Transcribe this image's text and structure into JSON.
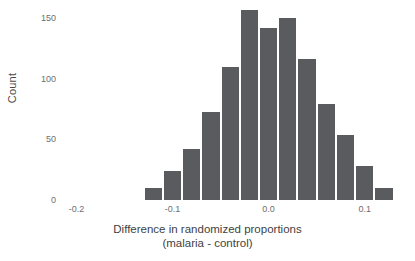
{
  "chart_data": {
    "type": "bar",
    "title": "",
    "subtitle": "",
    "xlabel": "Difference in randomized proportions",
    "xlabel_line2": "(malaria - control)",
    "ylabel": "Count",
    "bin_width": 0.02,
    "categories": [
      -0.12,
      -0.1,
      -0.08,
      -0.06,
      -0.04,
      -0.02,
      0.0,
      0.02,
      0.04,
      0.06,
      0.08,
      0.1,
      0.12
    ],
    "bin_left_edges": [
      -0.13,
      -0.11,
      -0.09,
      -0.07,
      -0.05,
      -0.03,
      -0.01,
      0.01,
      0.03,
      0.05,
      0.07,
      0.09,
      0.11
    ],
    "values": [
      10,
      24,
      42,
      73,
      110,
      157,
      142,
      150,
      116,
      79,
      54,
      28,
      10
    ],
    "xlim": [
      -0.215,
      0.145
    ],
    "ylim": [
      0,
      160
    ],
    "xticks": [
      -0.2,
      -0.1,
      0.0,
      0.1
    ],
    "xticklabels": [
      "-0.2",
      "-0.1",
      "0.0",
      "0.1"
    ],
    "yticks": [
      0,
      50,
      100,
      150
    ],
    "yticklabels": [
      "0",
      "50",
      "100",
      "150"
    ],
    "grid": false,
    "legend": null,
    "bar_color": "#5a5b5e",
    "bar_gap_color": "#ffffff",
    "axis_text_color": "#6e6e6e",
    "label_text_color": "#3f3f3f"
  }
}
